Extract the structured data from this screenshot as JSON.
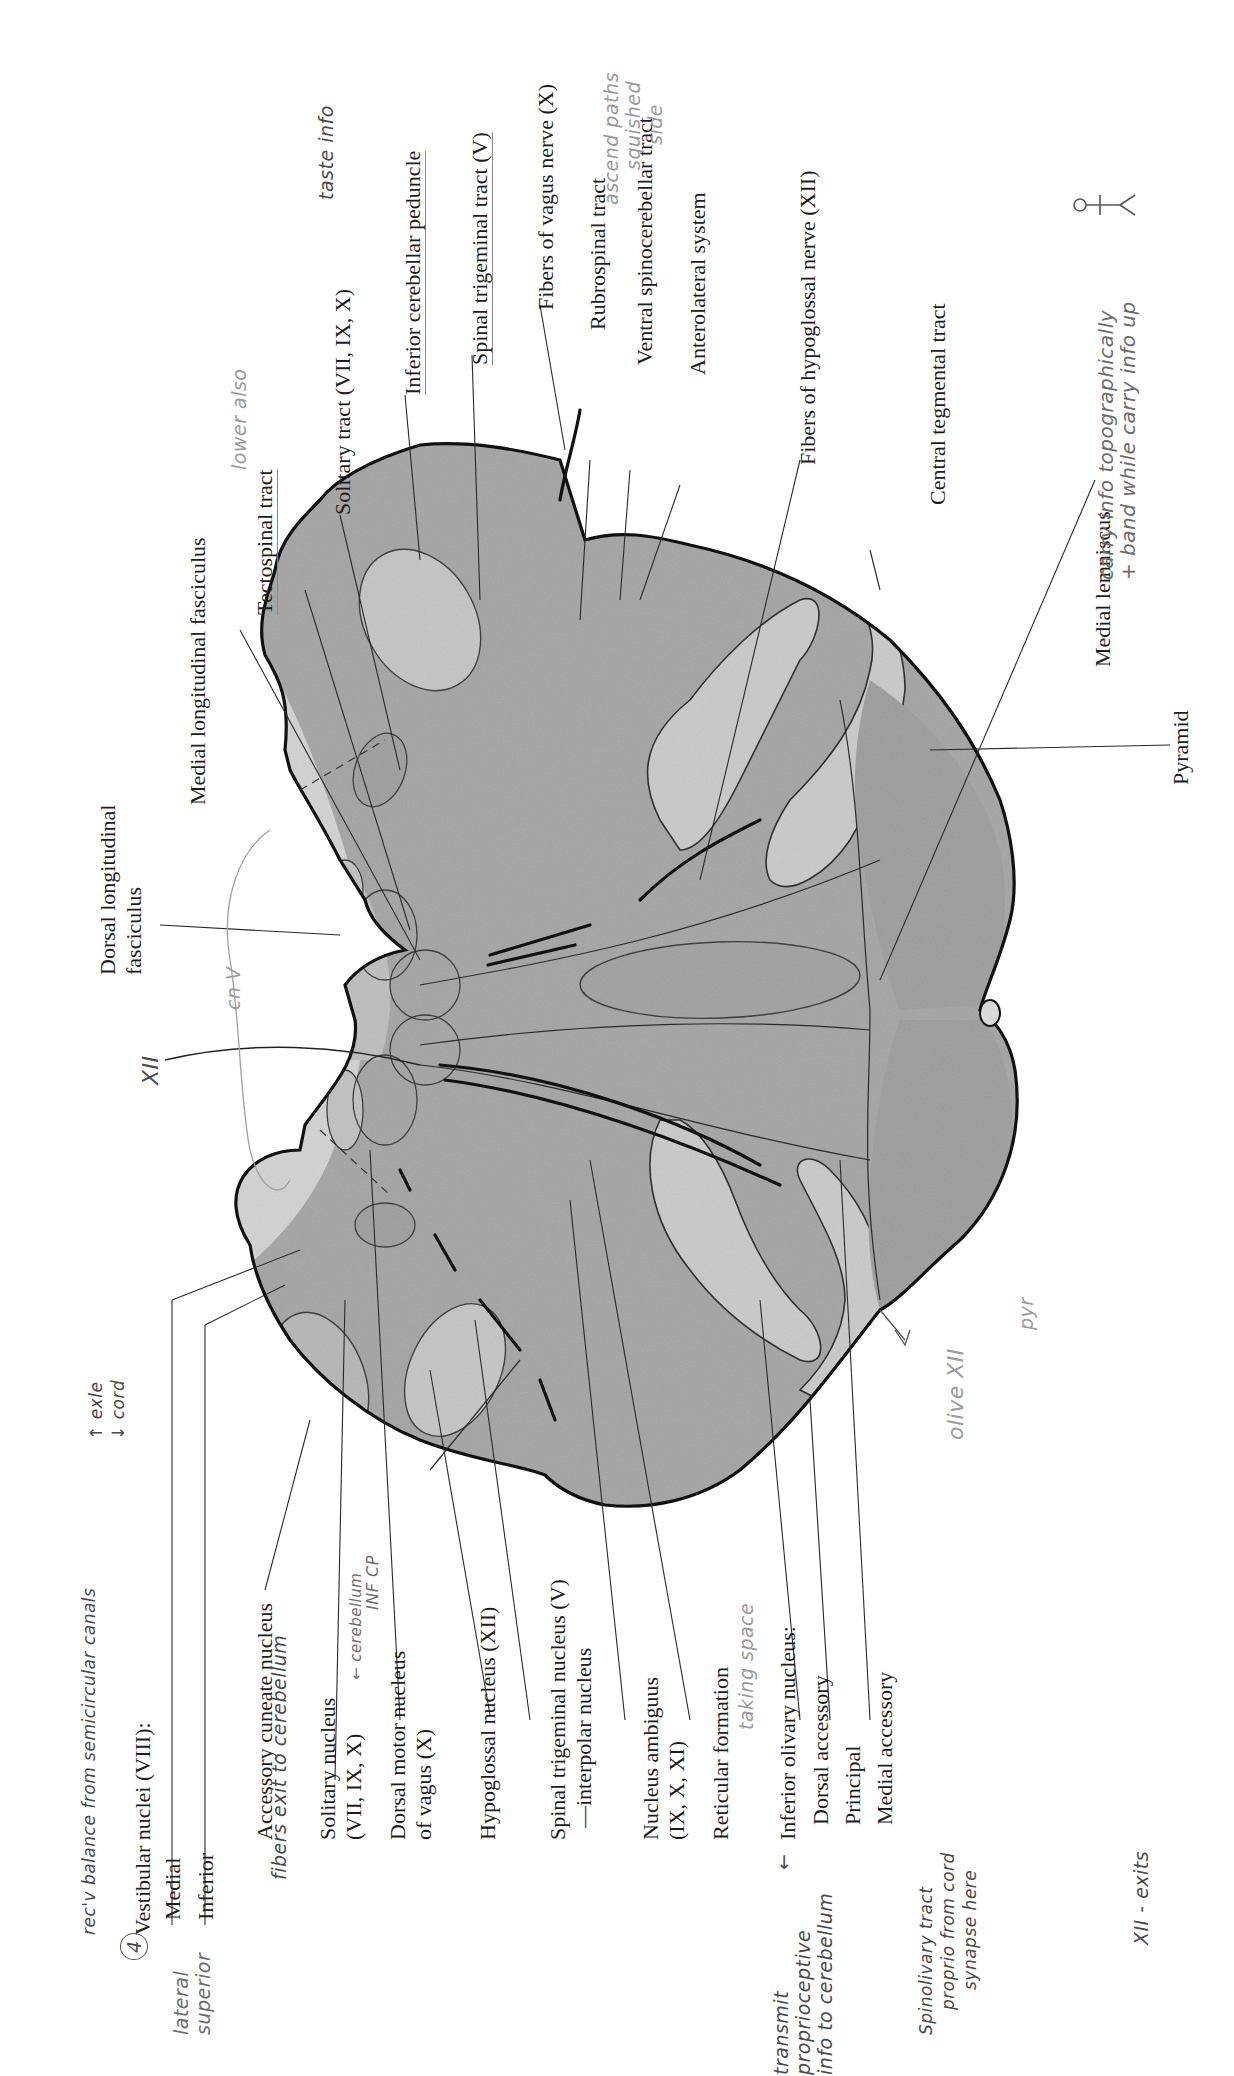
{
  "figure": {
    "colors": {
      "tissue": "#9a9a9a",
      "tissue_light": "#cfcfcf",
      "outline": "#111111",
      "leader": "#2a2a2a",
      "handwriting": "#6b6b6b",
      "background": "#ffffff"
    }
  },
  "labels_left": {
    "vestibular_header": "Vestibular nuclei (VIII):",
    "vestibular_medial": "Medial",
    "vestibular_inferior": "Inferior",
    "accessory_cuneate": "Accessory cuneate nucleus",
    "solitary_nucleus_1": "Solitary nucleus",
    "solitary_nucleus_2": "(VII, IX, X)",
    "dorsal_motor_1": "Dorsal motor nucleus",
    "dorsal_motor_2": "of vagus (X)",
    "hypoglossal_nucleus": "Hypoglossal nucleus (XII)",
    "spinal_trigeminal_nucleus_1": "Spinal trigeminal nucleus (V)",
    "spinal_trigeminal_nucleus_2": "—interpolar nucleus",
    "nucleus_ambiguus_1": "Nucleus ambiguus",
    "nucleus_ambiguus_2": "(IX, X, XI)",
    "reticular_formation": "Reticular formation",
    "inferior_olivary_header": "Inferior olivary nucleus:",
    "olivary_dorsal_accessory": "Dorsal accessory",
    "olivary_principal": "Principal",
    "olivary_medial_accessory": "Medial accessory"
  },
  "labels_top": {
    "dorsal_longitudinal_1": "Dorsal longitudinal",
    "dorsal_longitudinal_2": "fasciculus",
    "medial_longitudinal": "Medial longitudinal fasciculus",
    "tectospinal": "Tectospinal tract",
    "solitary_tract": "Solitary tract (VII, IX, X)",
    "inferior_cerebellar_peduncle": "Inferior cerebellar peduncle",
    "spinal_trigeminal_tract": "Spinal trigeminal tract (V)",
    "fibers_vagus": "Fibers of vagus nerve (X)",
    "rubrospinal": "Rubrospinal tract",
    "ventral_spinocerebellar": "Ventral spinocerebellar tract",
    "anterolateral": "Anterolateral system",
    "fibers_hypoglossal": "Fibers of hypoglossal nerve (XII)",
    "central_tegmental": "Central tegmental tract",
    "medial_lemniscus": "Medial lemniscus",
    "pyramid": "Pyramid"
  },
  "handwritten_notes": {
    "circled_number": "4",
    "lateral_superior_1": "lateral",
    "lateral_superior_2": "superior",
    "vestibular_note": "rec'v balance from semicircular canals",
    "vestibular_arrows_1": "↑ exle",
    "vestibular_arrows_2": "↓ cord",
    "accessory_cuneate_note": "fibers exit to cerebellum",
    "solitary_note": "← cerebellum",
    "inf_cp": "INF CP",
    "reticular_note": "taking space",
    "olive_arrow": "←",
    "olive_note_1": "transmit",
    "olive_note_2": "proprioceptive",
    "olive_note_3": "info to cerebellum",
    "spino_note_1": "Spinolivary tract",
    "spino_note_2": "proprio from cord",
    "spino_note_3": "synapse here",
    "xii_exits": "XII - exits",
    "xii_left": "XII",
    "cn4": "cn V",
    "olive_xii": "olive XII",
    "pyr": "pyr",
    "tectospinal_note": "lower also",
    "solitary_tract_note": "taste info",
    "ascending_note_1": "ascend paths",
    "ascending_note_2": "squished",
    "ascending_note_3": "side",
    "lemniscus_note_1": "carry info topographically",
    "lemniscus_note_2": "+ band while carry info up",
    "lemniscus_note_sup": "info"
  }
}
